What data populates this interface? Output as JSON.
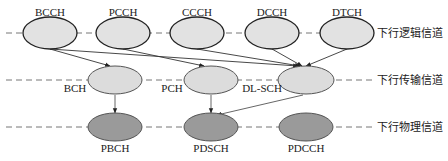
{
  "layers": {
    "logical": {
      "label": "下行逻辑信道",
      "y": 33
    },
    "transport": {
      "label": "下行传输信道",
      "y": 80
    },
    "physical": {
      "label": "下行物理信道",
      "y": 127
    }
  },
  "nodes": {
    "logical": [
      {
        "id": "BCCH",
        "label": "BCCH",
        "x": 50
      },
      {
        "id": "PCCH",
        "label": "PCCH",
        "x": 123
      },
      {
        "id": "CCCH",
        "label": "CCCH",
        "x": 197
      },
      {
        "id": "DCCH",
        "label": "DCCH",
        "x": 272
      },
      {
        "id": "DTCH",
        "label": "DTCH",
        "x": 347
      }
    ],
    "transport": [
      {
        "id": "BCH",
        "label": "BCH",
        "x": 115
      },
      {
        "id": "PCH",
        "label": "PCH",
        "x": 211
      },
      {
        "id": "DLSCH",
        "label": "DL-SCH",
        "x": 306
      }
    ],
    "physical": [
      {
        "id": "PBCH",
        "label": "PBCH",
        "x": 115
      },
      {
        "id": "PDSCH",
        "label": "PDSCH",
        "x": 211
      },
      {
        "id": "PDCCH",
        "label": "PDCCH",
        "x": 306
      }
    ]
  },
  "edges": [
    [
      "BCCH",
      "BCH"
    ],
    [
      "BCCH",
      "DLSCH"
    ],
    [
      "PCCH",
      "PCH"
    ],
    [
      "CCCH",
      "DLSCH"
    ],
    [
      "DCCH",
      "DLSCH"
    ],
    [
      "DTCH",
      "DLSCH"
    ],
    [
      "BCH",
      "PBCH"
    ],
    [
      "PCH",
      "PDSCH"
    ],
    [
      "DLSCH",
      "PDSCH"
    ]
  ],
  "colors": {
    "logical_fill": "#e2e2e2",
    "transport_fill": "#dcdcdc",
    "physical_fill": "#9a9a9a",
    "stroke": "#333333",
    "dash": "#777777"
  }
}
